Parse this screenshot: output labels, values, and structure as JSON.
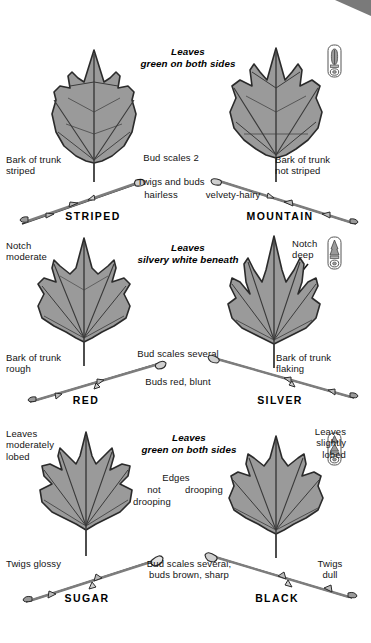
{
  "colors": {
    "leaf_fill": "#9a9a9a",
    "leaf_outline": "#2b2b2b",
    "vein": "#3a3a3a",
    "text": "#141414",
    "corner_marker": "#7a7a7a",
    "page_bg": "#ffffff"
  },
  "corner_marker": {
    "name": "page-corner-triangle"
  },
  "groups": [
    {
      "id": "group-1",
      "heading": "Leaves\ngreen on both sides",
      "badge_icon": "bud-detail-badge-icon",
      "center_labels": [
        {
          "name": "bud-scales-note",
          "text": "Bud scales 2"
        },
        {
          "name": "twigs-and-buds-note",
          "text": "Twigs and buds"
        }
      ],
      "left": {
        "name": "STRIPED",
        "leaf_icon": "striped-maple-leaf-icon",
        "twig_icon": "striped-maple-twig-icon",
        "labels": [
          {
            "name": "bark-note",
            "text": "Bark of trunk\nstriped"
          },
          {
            "name": "twig-texture-note",
            "text": "hairless"
          }
        ]
      },
      "right": {
        "name": "MOUNTAIN",
        "leaf_icon": "mountain-maple-leaf-icon",
        "twig_icon": "mountain-maple-twig-icon",
        "labels": [
          {
            "name": "bark-note",
            "text": "Bark of trunk\nnot striped"
          },
          {
            "name": "twig-texture-note",
            "text": "velvety-hairy"
          }
        ]
      }
    },
    {
      "id": "group-2",
      "heading": "Leaves\nsilvery white beneath",
      "badge_icon": "bud-detail-badge-icon",
      "center_labels": [
        {
          "name": "bud-scales-note",
          "text": "Bud scales several"
        },
        {
          "name": "bud-color-note",
          "text": "Buds red, blunt"
        }
      ],
      "left": {
        "name": "RED",
        "leaf_icon": "red-maple-leaf-icon",
        "twig_icon": "red-maple-twig-icon",
        "labels": [
          {
            "name": "notch-note",
            "text": "Notch\nmoderate"
          },
          {
            "name": "bark-note",
            "text": "Bark of trunk\nrough"
          }
        ]
      },
      "right": {
        "name": "SILVER",
        "leaf_icon": "silver-maple-leaf-icon",
        "twig_icon": "silver-maple-twig-icon",
        "labels": [
          {
            "name": "notch-note",
            "text": "Notch\ndeep"
          },
          {
            "name": "bark-note",
            "text": "Bark of trunk\nflaking"
          }
        ]
      }
    },
    {
      "id": "group-3",
      "heading": "Leaves\ngreen on both sides",
      "badge_icon": "bud-detail-badge-icon",
      "center_labels": [
        {
          "name": "edges-note-1",
          "text": "Edges"
        },
        {
          "name": "edges-note-2",
          "text": "not"
        },
        {
          "name": "edges-note-3",
          "text": "drooping"
        },
        {
          "name": "edges-note-4",
          "text": "drooping"
        },
        {
          "name": "bud-scales-note",
          "text": "Bud scales several;\nbuds brown, sharp"
        }
      ],
      "left": {
        "name": "SUGAR",
        "leaf_icon": "sugar-maple-leaf-icon",
        "twig_icon": "sugar-maple-twig-icon",
        "labels": [
          {
            "name": "lobe-note",
            "text": "Leaves\nmoderately\nlobed"
          },
          {
            "name": "twig-note",
            "text": "Twigs glossy"
          }
        ]
      },
      "right": {
        "name": "BLACK",
        "leaf_icon": "black-maple-leaf-icon",
        "twig_icon": "black-maple-twig-icon",
        "labels": [
          {
            "name": "lobe-note",
            "text": "Leaves\nslightly\nlobed"
          },
          {
            "name": "twig-note",
            "text": "Twigs\ndull"
          }
        ]
      }
    }
  ]
}
